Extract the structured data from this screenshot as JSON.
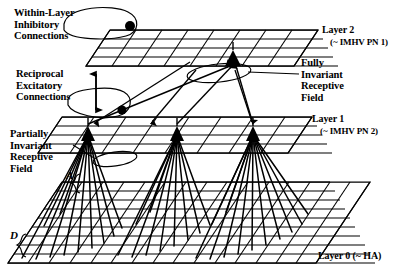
{
  "figure": {
    "kind": "neural-network-layer-diagram",
    "background_color": "#ffffff",
    "ink_color": "#000000"
  },
  "annotations": {
    "within_layer_inhibitory": "Within-Layer\nInhibitory\nConnections",
    "reciprocal_excitatory": "Reciprocal\nExcitatory\nConnections",
    "partially_invariant": "Partially\nInvariant\nReceptive\nField",
    "fully_invariant": "Fully\nInvariant\nReceptive\nField"
  },
  "layers": [
    {
      "id": "layer2",
      "name": "Layer 2",
      "subtitle": "(~ IMHV PN 1)",
      "rows": 4,
      "cols": 8,
      "neurons": 1
    },
    {
      "id": "layer1",
      "name": "Layer 1",
      "subtitle": "(~ IMHV PN 2)",
      "rows": 4,
      "cols": 8,
      "neurons": 3
    },
    {
      "id": "layer0",
      "name": "Layer 0 (~ HA)",
      "subtitle": "",
      "rows": 9,
      "cols": 13,
      "neurons": 0
    }
  ],
  "markers": {
    "a": "A",
    "d": "D"
  }
}
